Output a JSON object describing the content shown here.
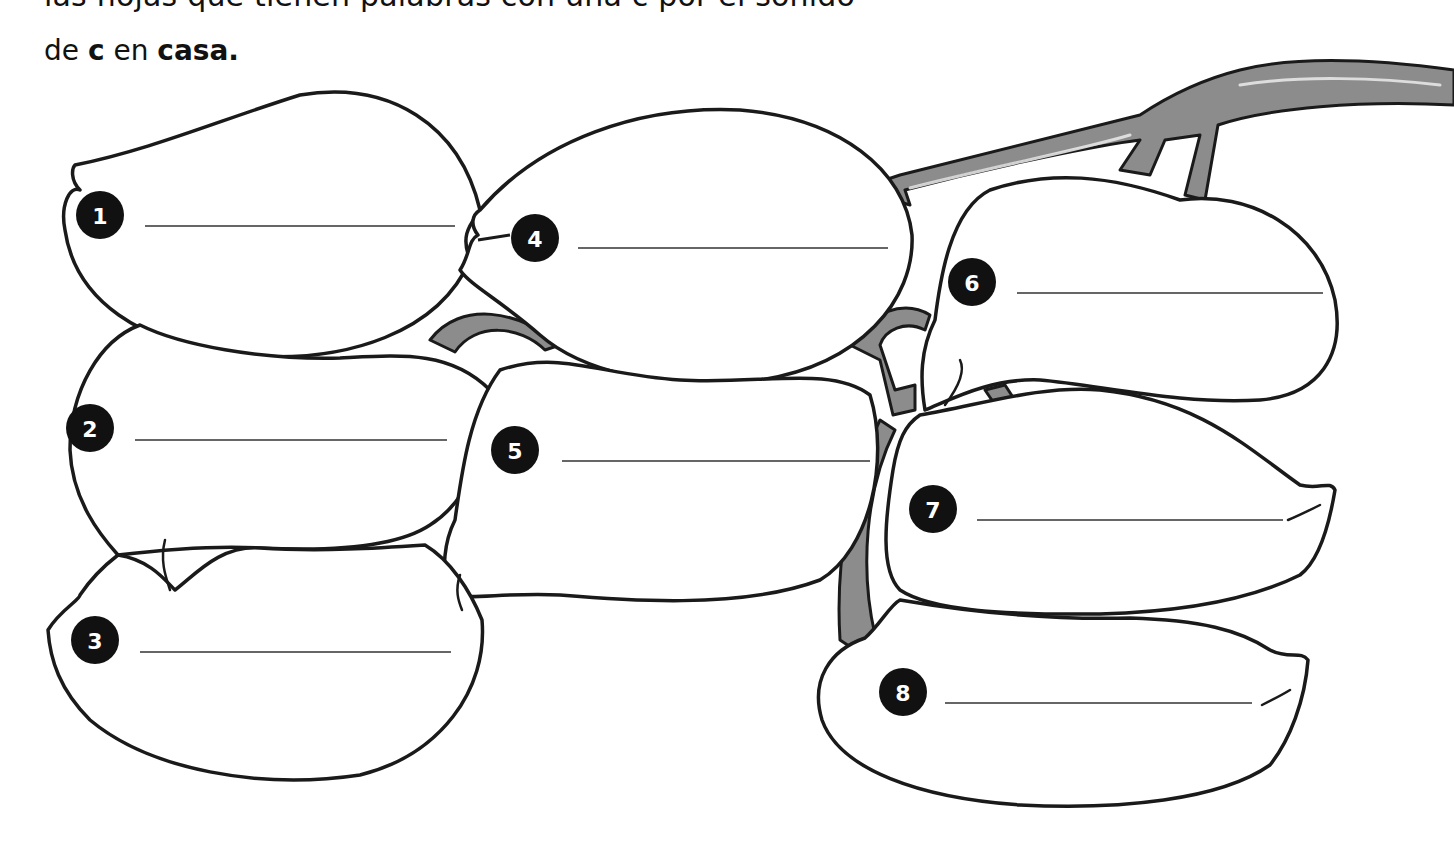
{
  "worksheet": {
    "partial_line": "las hojas que tienen palabras con una c por el sonido",
    "instruction": {
      "prefix": "de ",
      "letter": "c",
      "middle": " en ",
      "word": "casa."
    }
  },
  "leaves": [
    {
      "number": "1",
      "answer": ""
    },
    {
      "number": "2",
      "answer": ""
    },
    {
      "number": "3",
      "answer": ""
    },
    {
      "number": "4",
      "answer": ""
    },
    {
      "number": "5",
      "answer": ""
    },
    {
      "number": "6",
      "answer": ""
    },
    {
      "number": "7",
      "answer": ""
    },
    {
      "number": "8",
      "answer": ""
    }
  ]
}
